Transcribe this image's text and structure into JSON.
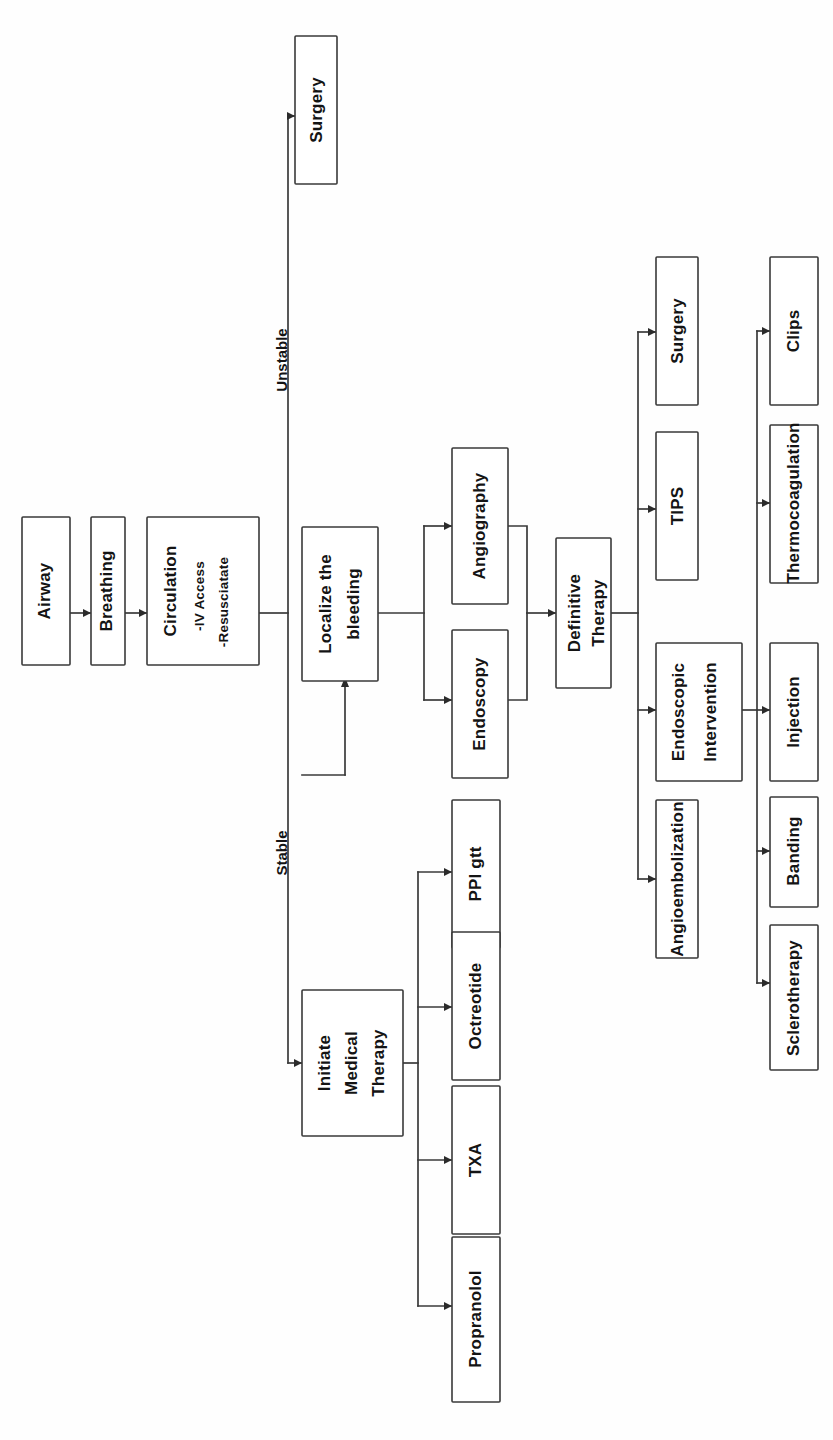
{
  "diagram": {
    "orientation": "rotated-90-ccw",
    "colors": {
      "box_stroke": "#3a3a3a",
      "text": "#141414",
      "background": "#ffffff",
      "line": "#3a3a3a"
    },
    "nodes": {
      "airway": {
        "label": "Airway"
      },
      "breathing": {
        "label": "Breathing"
      },
      "circulation": {
        "label": "Circulation",
        "line2": "-IV Access",
        "line3": "-Resusciatate"
      },
      "surgery_unstable": {
        "label": "Surgery"
      },
      "localize": {
        "label_line1": "Localize the",
        "label_line2": "bleeding"
      },
      "angiography": {
        "label": "Angiography"
      },
      "endoscopy": {
        "label": "Endoscopy"
      },
      "definitive": {
        "label_line1": "Definitive",
        "label_line2": "Therapy"
      },
      "surgery_def": {
        "label": "Surgery"
      },
      "tips": {
        "label": "TIPS"
      },
      "endoscopic_intervention": {
        "label_line1": "Endoscopic",
        "label_line2": "Intervention"
      },
      "angioembolization": {
        "label": "Angioembolization"
      },
      "clips": {
        "label": "Clips"
      },
      "thermocoagulation": {
        "label": "Thermocoagulation"
      },
      "injection": {
        "label": "Injection"
      },
      "banding": {
        "label": "Banding"
      },
      "sclerotherapy": {
        "label": "Sclerotherapy"
      },
      "initiate_medical": {
        "label_line1": "Initiate",
        "label_line2": "Medical",
        "label_line3": "Therapy"
      },
      "ppi_gtt": {
        "label": "PPI gtt"
      },
      "octreotide": {
        "label": "Octreotide"
      },
      "txa": {
        "label": "TXA"
      },
      "propranolol": {
        "label": "Propranolol"
      }
    },
    "edge_labels": {
      "unstable": "Unstable",
      "stable": "Stable"
    }
  }
}
